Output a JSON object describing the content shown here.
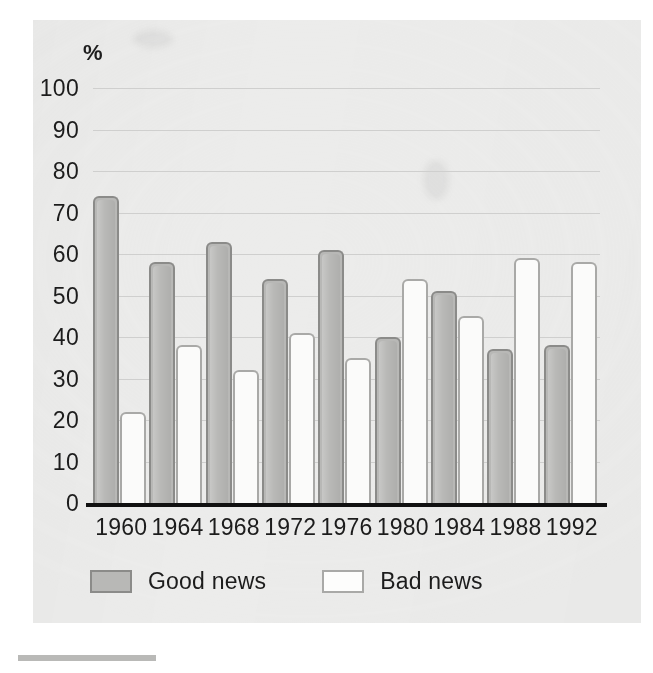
{
  "chart_data": {
    "type": "bar",
    "title": "",
    "xlabel": "",
    "ylabel": "%",
    "ylim": [
      0,
      100
    ],
    "yticks": [
      100,
      90,
      80,
      70,
      60,
      50,
      40,
      30,
      20,
      10,
      0
    ],
    "grid": true,
    "legend_position": "bottom-left",
    "categories": [
      "1960",
      "1964",
      "1968",
      "1972",
      "1976",
      "1980",
      "1984",
      "1988",
      "1992"
    ],
    "series": [
      {
        "name": "Good news",
        "color": "#b8b8b6",
        "values": [
          74,
          58,
          63,
          54,
          61,
          40,
          51,
          37,
          38
        ]
      },
      {
        "name": "Bad news",
        "color": "#fbfbfa",
        "values": [
          22,
          38,
          32,
          41,
          35,
          54,
          45,
          59,
          58
        ]
      }
    ]
  },
  "axis": {
    "y_unit_label": "%",
    "y_tick_labels": [
      "100",
      "90",
      "80",
      "70",
      "60",
      "50",
      "40",
      "30",
      "20",
      "10",
      "0"
    ],
    "x_tick_labels": [
      "1960",
      "1964",
      "1968",
      "1972",
      "1976",
      "1980",
      "1984",
      "1988",
      "1992"
    ]
  },
  "legend": {
    "items": [
      {
        "label": "Good news",
        "swatch": "good"
      },
      {
        "label": "Bad news",
        "swatch": "bad"
      }
    ]
  }
}
